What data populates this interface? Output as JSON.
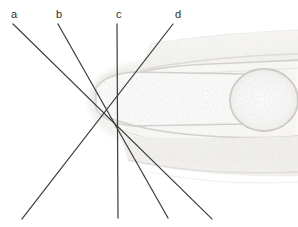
{
  "figure": {
    "width": 298,
    "height": 227,
    "background_color": "#ffffff",
    "description_kind": "histology-micrograph-with-measurement-axes"
  },
  "labels": [
    {
      "id": "a",
      "text": "a",
      "x": 11,
      "y": 9
    },
    {
      "id": "b",
      "text": "b",
      "x": 56,
      "y": 9
    },
    {
      "id": "c",
      "text": "c",
      "x": 116,
      "y": 9
    },
    {
      "id": "d",
      "text": "d",
      "x": 175,
      "y": 9
    }
  ],
  "lines": {
    "color": "#3b3b3b",
    "width": 1.2,
    "convergence_point": {
      "x": 117,
      "y": 97
    },
    "items": [
      {
        "id": "a",
        "x1": 13,
        "y1": 24,
        "x2": 212,
        "y2": 219
      },
      {
        "id": "b",
        "x1": 58,
        "y1": 24,
        "x2": 168,
        "y2": 218
      },
      {
        "id": "c",
        "x1": 117,
        "y1": 24,
        "x2": 118,
        "y2": 218
      },
      {
        "id": "d",
        "x1": 173,
        "y1": 24,
        "x2": 22,
        "y2": 219
      }
    ]
  },
  "micrograph": {
    "tint_light": "#f2f1ef",
    "tint_mid": "#dedcd8",
    "tint_dark": "#c4c2be",
    "tint_deep": "#a9a7a3",
    "bone_fill": "#fbfafa",
    "speckle_color": "#b9b7b3",
    "regions": [
      {
        "name": "upper-striated-tissue-band",
        "tone": "#e7e5e1"
      },
      {
        "name": "proximal-phalanx-shaft",
        "tone": "#fbfbfa"
      },
      {
        "name": "joint-space",
        "tone": "#cfcdc9"
      },
      {
        "name": "distal-epiphysis-round",
        "tone": "#fbfbfa"
      },
      {
        "name": "lower-striated-tissue-band",
        "tone": "#e3e1dd"
      },
      {
        "name": "soft-tissue-cap-left",
        "tone": "#ddd9d5"
      }
    ]
  }
}
